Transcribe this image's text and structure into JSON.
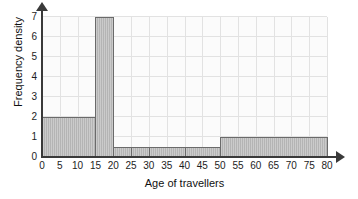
{
  "chart_data": {
    "type": "bar",
    "title": "",
    "xlabel": "Age of travellers",
    "ylabel": "Frequency density",
    "xlim": [
      0,
      80
    ],
    "ylim": [
      0,
      7
    ],
    "grid": true,
    "legend": "none",
    "xticks": [
      0,
      5,
      10,
      15,
      20,
      25,
      30,
      35,
      40,
      45,
      50,
      55,
      60,
      65,
      70,
      75,
      80
    ],
    "yticks": [
      0,
      1,
      2,
      3,
      4,
      5,
      6,
      7
    ],
    "bar_color": "#b4b4b4",
    "bar_edge_color": "#6a6a6a",
    "bins": [
      {
        "label": "0-15",
        "x0": 0,
        "x1": 15,
        "value": 2
      },
      {
        "label": "15-20",
        "x0": 15,
        "x1": 20,
        "value": 7
      },
      {
        "label": "20-25",
        "x0": 20,
        "x1": 25,
        "value": 0.5
      },
      {
        "label": "25-30",
        "x0": 25,
        "x1": 30,
        "value": 0.5
      },
      {
        "label": "30-40",
        "x0": 30,
        "x1": 40,
        "value": 0.5
      },
      {
        "label": "40-50",
        "x0": 40,
        "x1": 50,
        "value": 0.5
      },
      {
        "label": "50-80",
        "x0": 50,
        "x1": 80,
        "value": 1
      }
    ]
  }
}
